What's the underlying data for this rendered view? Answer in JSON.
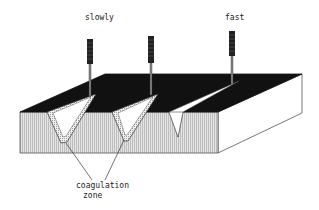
{
  "diagram": {
    "labels": {
      "slowly": "slowly",
      "fast": "fast",
      "coagulation_line1": "coagulation",
      "coagulation_line2": "zone"
    },
    "instruments": [
      {
        "name": "instrument-slow-1",
        "speed": "slowly",
        "has_coagulation_zone": true
      },
      {
        "name": "instrument-slow-2",
        "speed": "slowly",
        "has_coagulation_zone": true
      },
      {
        "name": "instrument-fast",
        "speed": "fast",
        "has_coagulation_zone": false
      }
    ],
    "colors": {
      "top_surface": "#111111",
      "front_face": "#cfcfcf",
      "side_face": "#ffffff",
      "coag_zone": "#d8d8d8",
      "outline": "#333333"
    }
  }
}
